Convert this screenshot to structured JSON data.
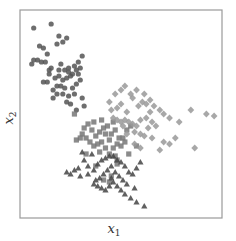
{
  "chart_data": {
    "type": "scatter",
    "title": "",
    "xlabel": "x1",
    "ylabel": "x2",
    "xlabel_main": "x",
    "xlabel_sub": "1",
    "ylabel_main": "x",
    "ylabel_sub": "2",
    "grid": false,
    "ticks": false,
    "legend": null,
    "frame": {
      "left": 20,
      "top": 10,
      "right": 222,
      "bottom": 218,
      "color": "#9a9a9a"
    },
    "xlim": [
      0,
      100
    ],
    "ylim": [
      0,
      100
    ],
    "series": [
      {
        "name": "circles",
        "marker": "circle",
        "color": "#555555",
        "points": [
          [
            5,
            93
          ],
          [
            14,
            95
          ],
          [
            18,
            89
          ],
          [
            20,
            86
          ],
          [
            22,
            88
          ],
          [
            8,
            84
          ],
          [
            10,
            83
          ],
          [
            17,
            85
          ],
          [
            7,
            77
          ],
          [
            9,
            76
          ],
          [
            11,
            76
          ],
          [
            4,
            75
          ],
          [
            5,
            77
          ],
          [
            13,
            72
          ],
          [
            14,
            73
          ],
          [
            18,
            72
          ],
          [
            21,
            72
          ],
          [
            23,
            71
          ],
          [
            26,
            74
          ],
          [
            28,
            76
          ],
          [
            30,
            79
          ],
          [
            29,
            73
          ],
          [
            27,
            72
          ],
          [
            25,
            70
          ],
          [
            24,
            69
          ],
          [
            22,
            68
          ],
          [
            20,
            67
          ],
          [
            18,
            69
          ],
          [
            16,
            68
          ],
          [
            13,
            70
          ],
          [
            12,
            66
          ],
          [
            10,
            66
          ],
          [
            17,
            64
          ],
          [
            19,
            64
          ],
          [
            21,
            63
          ],
          [
            25,
            63
          ],
          [
            27,
            65
          ],
          [
            29,
            67
          ],
          [
            26,
            60
          ],
          [
            23,
            59
          ],
          [
            20,
            60
          ],
          [
            17,
            60
          ],
          [
            15,
            58
          ],
          [
            22,
            56
          ],
          [
            24,
            55
          ],
          [
            27,
            52
          ],
          [
            30,
            58
          ],
          [
            31,
            54
          ],
          [
            23,
            73
          ],
          [
            19,
            75
          ],
          [
            12,
            80
          ],
          [
            28,
            70
          ],
          [
            15,
            62
          ]
        ]
      },
      {
        "name": "squares",
        "marker": "square",
        "color": "#777777",
        "points": [
          [
            26,
            50
          ],
          [
            33,
            45
          ],
          [
            35,
            42
          ],
          [
            30,
            40
          ],
          [
            32,
            38
          ],
          [
            37,
            39
          ],
          [
            39,
            41
          ],
          [
            41,
            43
          ],
          [
            43,
            44
          ],
          [
            42,
            40
          ],
          [
            45,
            40
          ],
          [
            47,
            42
          ],
          [
            49,
            38
          ],
          [
            51,
            38
          ],
          [
            44,
            37
          ],
          [
            40,
            36
          ],
          [
            38,
            35
          ],
          [
            36,
            34
          ],
          [
            34,
            36
          ],
          [
            29,
            38
          ],
          [
            27,
            37
          ],
          [
            42,
            33
          ],
          [
            46,
            33
          ],
          [
            48,
            35
          ],
          [
            50,
            34
          ],
          [
            52,
            36
          ],
          [
            44,
            30
          ],
          [
            47,
            29
          ],
          [
            39,
            31
          ],
          [
            32,
            30
          ],
          [
            53,
            42
          ],
          [
            55,
            44
          ],
          [
            36,
            46
          ],
          [
            40,
            47
          ],
          [
            46,
            46
          ],
          [
            48,
            27
          ],
          [
            54,
            30
          ],
          [
            58,
            34
          ],
          [
            37,
            24
          ],
          [
            48,
            25
          ],
          [
            45,
            19
          ],
          [
            41,
            17
          ],
          [
            44,
            16
          ],
          [
            31,
            43
          ]
        ]
      },
      {
        "name": "diamonds",
        "marker": "diamond",
        "color": "#999999",
        "points": [
          [
            44,
            56
          ],
          [
            48,
            53
          ],
          [
            50,
            55
          ],
          [
            53,
            51
          ],
          [
            56,
            58
          ],
          [
            59,
            54
          ],
          [
            61,
            56
          ],
          [
            63,
            55
          ],
          [
            65,
            57
          ],
          [
            67,
            54
          ],
          [
            70,
            52
          ],
          [
            72,
            50
          ],
          [
            75,
            48
          ],
          [
            62,
            60
          ],
          [
            58,
            62
          ],
          [
            55,
            60
          ],
          [
            52,
            64
          ],
          [
            50,
            62
          ],
          [
            47,
            60
          ],
          [
            45,
            52
          ],
          [
            46,
            48
          ],
          [
            48,
            47
          ],
          [
            50,
            46
          ],
          [
            52,
            47
          ],
          [
            54,
            46
          ],
          [
            56,
            45
          ],
          [
            58,
            44
          ],
          [
            60,
            47
          ],
          [
            63,
            48
          ],
          [
            66,
            46
          ],
          [
            68,
            44
          ],
          [
            64,
            43
          ],
          [
            60,
            40
          ],
          [
            62,
            39
          ],
          [
            57,
            41
          ],
          [
            53,
            40
          ],
          [
            66,
            38
          ],
          [
            72,
            36
          ],
          [
            75,
            35
          ],
          [
            78,
            38
          ],
          [
            88,
            33
          ],
          [
            70,
            32
          ],
          [
            86,
            52
          ],
          [
            94,
            50
          ],
          [
            98,
            49
          ],
          [
            80,
            46
          ],
          [
            57,
            35
          ],
          [
            60,
            33
          ],
          [
            51,
            44
          ],
          [
            65,
            51
          ]
        ]
      },
      {
        "name": "triangles",
        "marker": "triangle",
        "color": "#444444",
        "points": [
          [
            30,
            31
          ],
          [
            35,
            30
          ],
          [
            31,
            27
          ],
          [
            26,
            22
          ],
          [
            28,
            23
          ],
          [
            22,
            21
          ],
          [
            24,
            20
          ],
          [
            33,
            20
          ],
          [
            36,
            22
          ],
          [
            38,
            25
          ],
          [
            40,
            27
          ],
          [
            42,
            28
          ],
          [
            44,
            29
          ],
          [
            46,
            29
          ],
          [
            48,
            27
          ],
          [
            50,
            26
          ],
          [
            52,
            24
          ],
          [
            45,
            24
          ],
          [
            43,
            22
          ],
          [
            41,
            20
          ],
          [
            39,
            18
          ],
          [
            37,
            17
          ],
          [
            47,
            21
          ],
          [
            49,
            19
          ],
          [
            51,
            17
          ],
          [
            54,
            21
          ],
          [
            56,
            20
          ],
          [
            58,
            23
          ],
          [
            60,
            26
          ],
          [
            46,
            16
          ],
          [
            44,
            14
          ],
          [
            42,
            12
          ],
          [
            40,
            13
          ],
          [
            38,
            14
          ],
          [
            36,
            15
          ],
          [
            48,
            14
          ],
          [
            50,
            12
          ],
          [
            52,
            10
          ],
          [
            55,
            8
          ],
          [
            58,
            6
          ],
          [
            62,
            4
          ],
          [
            33,
            24
          ],
          [
            29,
            19
          ],
          [
            45,
            18
          ],
          [
            53,
            15
          ],
          [
            57,
            13
          ]
        ]
      }
    ]
  }
}
